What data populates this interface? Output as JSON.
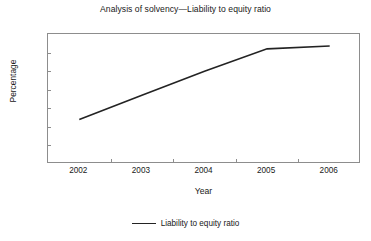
{
  "chart_data": {
    "type": "line",
    "title": "Analysis of solvency—Liability to equity ratio",
    "xlabel": "Year",
    "ylabel": "Percentage",
    "categories": [
      "2002",
      "2003",
      "2004",
      "2005",
      "2006"
    ],
    "series": [
      {
        "name": "Liability to equity ratio",
        "values": [
          44.8,
          47.4,
          50.0,
          52.4,
          52.7
        ],
        "color": "#232323"
      }
    ],
    "ylim": [
      40,
      54
    ],
    "ytick_step": 2,
    "yticks": [
      "54",
      "52",
      "50",
      "48",
      "46",
      "44",
      "42",
      "40"
    ],
    "grid": false,
    "legend_position": "bottom-center",
    "frame_color": "#8d8d8d",
    "background": "#ffffff"
  },
  "legend": {
    "entries": [
      {
        "label": "Liability to equity ratio",
        "marker": "line-marker"
      }
    ]
  }
}
